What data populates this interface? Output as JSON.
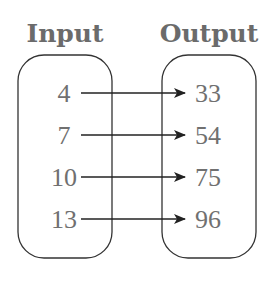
{
  "diagram": {
    "type": "mapping",
    "input_label": "Input",
    "output_label": "Output",
    "inputs": [
      "4",
      "7",
      "10",
      "13"
    ],
    "outputs": [
      "33",
      "54",
      "75",
      "96"
    ],
    "mappings": [
      {
        "from": "4",
        "to": "33"
      },
      {
        "from": "7",
        "to": "54"
      },
      {
        "from": "10",
        "to": "75"
      },
      {
        "from": "13",
        "to": "96"
      }
    ],
    "colors": {
      "text": "#707070",
      "lines": "#222222"
    }
  }
}
